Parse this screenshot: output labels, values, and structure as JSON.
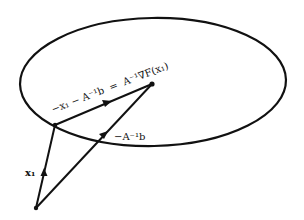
{
  "diagram": {
    "type": "vector-geometry",
    "colors": {
      "stroke": "#111111",
      "background": "#ffffff"
    },
    "ellipse": {
      "cx": 153,
      "cy": 82,
      "rx": 133,
      "ry": 64,
      "rotation": 0
    },
    "points": {
      "origin": {
        "x": 36,
        "y": 208
      },
      "x1": {
        "x": 55,
        "y": 125
      },
      "minimizer": {
        "x": 152,
        "y": 84
      }
    },
    "labels": {
      "x1_vector": "x₁",
      "neg_Ainv_b": "−A⁻¹b",
      "step_lhs": "−x₁ − A⁻¹b",
      "equals": "=",
      "step_rhs": "A⁻¹∇F(x₁)"
    },
    "vectors": [
      {
        "name": "x1",
        "from": "origin",
        "to": "x1",
        "label": "x₁"
      },
      {
        "name": "neg-Ainv-b",
        "from": "origin",
        "to": "minimizer",
        "label": "−A⁻¹b"
      },
      {
        "name": "newton-step",
        "from": "x1",
        "to": "minimizer",
        "label": "−x₁ − A⁻¹b = A⁻¹∇F(x₁)"
      }
    ]
  }
}
